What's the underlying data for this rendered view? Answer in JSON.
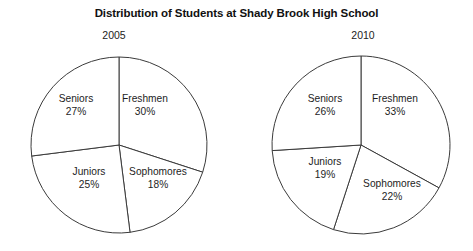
{
  "title": "Distribution of Students at Shady Brook High School",
  "charts": [
    {
      "year": "2005",
      "center": {
        "x": 119,
        "y": 145
      },
      "radius": 88,
      "slices": [
        {
          "name": "Freshmen",
          "pct": "30%",
          "value": 30,
          "label_x": 145,
          "label_y": 93
        },
        {
          "name": "Sophomores",
          "pct": "18%",
          "value": 18,
          "label_x": 158,
          "label_y": 166
        },
        {
          "name": "Juniors",
          "pct": "25%",
          "value": 25,
          "label_x": 89,
          "label_y": 166
        },
        {
          "name": "Seniors",
          "pct": "27%",
          "value": 27,
          "label_x": 76,
          "label_y": 93
        }
      ]
    },
    {
      "year": "2010",
      "center": {
        "x": 361,
        "y": 145
      },
      "radius": 89,
      "slices": [
        {
          "name": "Freshmen",
          "pct": "33%",
          "value": 33,
          "label_x": 395,
          "label_y": 93
        },
        {
          "name": "Sophomores",
          "pct": "22%",
          "value": 22,
          "label_x": 392,
          "label_y": 178
        },
        {
          "name": "Juniors",
          "pct": "19%",
          "value": 19,
          "label_x": 325,
          "label_y": 156
        },
        {
          "name": "Seniors",
          "pct": "26%",
          "value": 26,
          "label_x": 325,
          "label_y": 93
        }
      ]
    }
  ],
  "chart_data": {
    "type": "pie",
    "title": "Distribution of Students at Shady Brook High School",
    "xlabel": "",
    "ylabel": "",
    "legend": "none",
    "grid": false,
    "note": "Two side-by-side pie charts comparing student class distribution percentages in 2005 and 2010. Slices are unfilled (white) with thin dark outlines; each slice is labeled in place with class name and percentage.",
    "categories": [
      "Freshmen",
      "Sophomores",
      "Juniors",
      "Seniors"
    ],
    "series": [
      {
        "name": "2005",
        "values": [
          30,
          18,
          25,
          27
        ],
        "unit": "%"
      },
      {
        "name": "2010",
        "values": [
          33,
          22,
          19,
          26
        ],
        "unit": "%"
      }
    ],
    "pies": [
      {
        "title": "2005",
        "labels": [
          "Freshmen",
          "Sophomores",
          "Juniors",
          "Seniors"
        ],
        "values": [
          30,
          18,
          25,
          27
        ],
        "total": 100,
        "start_angle_deg": 0,
        "direction": "clockwise"
      },
      {
        "title": "2010",
        "labels": [
          "Freshmen",
          "Sophomores",
          "Juniors",
          "Seniors"
        ],
        "values": [
          33,
          22,
          19,
          26
        ],
        "total": 100,
        "start_angle_deg": 0,
        "direction": "clockwise"
      }
    ]
  },
  "colors": {
    "background": "#ffffff",
    "outline": "#3b3b3b",
    "text": "#1d1d1d",
    "title_text": "#111111"
  }
}
